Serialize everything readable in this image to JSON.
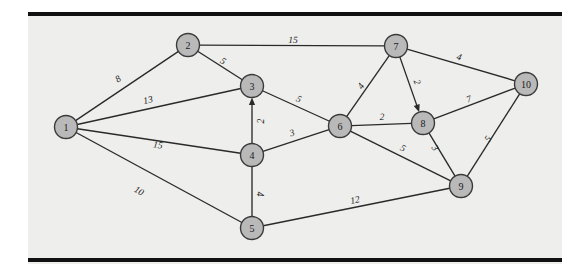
{
  "figure": {
    "kind": "weighted-network-graph",
    "background_color": "#eeeeec",
    "page_color": "#ffffff",
    "node_fill_color": "#b9b9b9",
    "node_stroke_color": "#3a3a3a",
    "edge_color": "#2a2a2a",
    "rule_color": "#111111"
  },
  "nodes": [
    {
      "id": "1",
      "label": "1",
      "x": 66,
      "y": 127
    },
    {
      "id": "2",
      "label": "2",
      "x": 188,
      "y": 45
    },
    {
      "id": "3",
      "label": "3",
      "x": 252,
      "y": 86
    },
    {
      "id": "4",
      "label": "4",
      "x": 252,
      "y": 155
    },
    {
      "id": "5",
      "label": "5",
      "x": 252,
      "y": 228
    },
    {
      "id": "6",
      "label": "6",
      "x": 340,
      "y": 126
    },
    {
      "id": "7",
      "label": "7",
      "x": 396,
      "y": 46
    },
    {
      "id": "8",
      "label": "8",
      "x": 423,
      "y": 123
    },
    {
      "id": "9",
      "label": "9",
      "x": 461,
      "y": 186
    },
    {
      "id": "10",
      "label": "10",
      "x": 526,
      "y": 84
    }
  ],
  "edges": [
    {
      "id": "e-1-2",
      "from": "1",
      "to": "2",
      "weight": "8",
      "lx": 118,
      "ly": 79,
      "directed": false
    },
    {
      "id": "e-1-3",
      "from": "1",
      "to": "3",
      "weight": "13",
      "lx": 148,
      "ly": 100,
      "directed": false
    },
    {
      "id": "e-1-4",
      "from": "1",
      "to": "4",
      "weight": "15",
      "lx": 158,
      "ly": 145,
      "directed": false
    },
    {
      "id": "e-1-5",
      "from": "1",
      "to": "5",
      "weight": "10",
      "lx": 139,
      "ly": 191,
      "directed": false
    },
    {
      "id": "e-2-7",
      "from": "2",
      "to": "7",
      "weight": "15",
      "lx": 293,
      "ly": 40,
      "directed": false
    },
    {
      "id": "e-2-3",
      "from": "2",
      "to": "3",
      "weight": "5",
      "lx": 223,
      "ly": 61,
      "directed": false
    },
    {
      "id": "e-4-3",
      "from": "4",
      "to": "3",
      "weight": "2",
      "lx": 261,
      "ly": 121,
      "directed": true
    },
    {
      "id": "e-3-6",
      "from": "3",
      "to": "6",
      "weight": "5",
      "lx": 299,
      "ly": 99,
      "directed": false
    },
    {
      "id": "e-4-6",
      "from": "4",
      "to": "6",
      "weight": "3",
      "lx": 292,
      "ly": 133,
      "directed": false
    },
    {
      "id": "e-4-5",
      "from": "4",
      "to": "5",
      "weight": "4",
      "lx": 260,
      "ly": 194,
      "directed": false
    },
    {
      "id": "e-5-9",
      "from": "5",
      "to": "9",
      "weight": "12",
      "lx": 355,
      "ly": 200,
      "directed": false
    },
    {
      "id": "e-6-7",
      "from": "6",
      "to": "7",
      "weight": "4",
      "lx": 361,
      "ly": 86,
      "directed": false
    },
    {
      "id": "e-6-8",
      "from": "6",
      "to": "8",
      "weight": "2",
      "lx": 382,
      "ly": 117,
      "directed": false
    },
    {
      "id": "e-6-9",
      "from": "6",
      "to": "9",
      "weight": "5",
      "lx": 403,
      "ly": 148,
      "directed": false
    },
    {
      "id": "e-7-8",
      "from": "7",
      "to": "8",
      "weight": "2",
      "lx": 417,
      "ly": 82,
      "directed": true
    },
    {
      "id": "e-7-10",
      "from": "7",
      "to": "10",
      "weight": "4",
      "lx": 459,
      "ly": 57,
      "directed": false
    },
    {
      "id": "e-8-10",
      "from": "8",
      "to": "10",
      "weight": "7",
      "lx": 469,
      "ly": 99,
      "directed": false
    },
    {
      "id": "e-8-9",
      "from": "8",
      "to": "9",
      "weight": "3",
      "lx": 435,
      "ly": 148,
      "directed": false
    },
    {
      "id": "e-9-10",
      "from": "9",
      "to": "10",
      "weight": "5",
      "lx": 488,
      "ly": 139,
      "directed": false
    }
  ]
}
